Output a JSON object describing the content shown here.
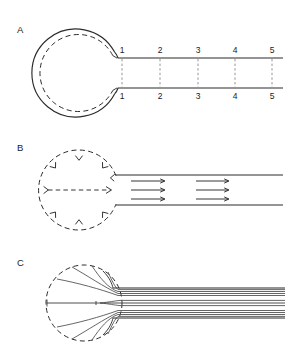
{
  "figure": {
    "background_color": "#ffffff",
    "ink_color": "#2b2b2b",
    "width": 288,
    "height": 363
  },
  "panels": [
    {
      "id": "A",
      "label": "A",
      "label_x": 17,
      "label_y": 33,
      "description": "Solid-walled spherical chamber with dashed inner boundary joined to a straight parallel-walled tube marked with five numbered stations",
      "chamber": {
        "style": "solid-outline-with-dashed-inner",
        "center_x": 79,
        "center_y": 73,
        "outer_radius": 44,
        "inner_radius": 38.5
      },
      "tube": {
        "top_wall_y": 58,
        "bottom_wall_y": 88,
        "start_x": 118,
        "end_x": 283
      },
      "stations": [
        {
          "label": "1",
          "x": 122
        },
        {
          "label": "2",
          "x": 160
        },
        {
          "label": "3",
          "x": 198
        },
        {
          "label": "4",
          "x": 235
        },
        {
          "label": "5",
          "x": 272
        }
      ],
      "station_label_top_y": 53,
      "station_label_bottom_y": 99
    },
    {
      "id": "B",
      "label": "B",
      "label_x": 17,
      "label_y": 151,
      "description": "Dashed spherical chamber with inward radial arrows and uniform plug-flow arrows inside the tube",
      "chamber": {
        "style": "dashed",
        "center_x": 79,
        "center_y": 190,
        "radius": 40
      },
      "tube": {
        "top_wall_y": 175,
        "bottom_wall_y": 205,
        "start_x": 116,
        "end_x": 283
      },
      "radial_arrow_count": 8,
      "center_arrow": {
        "label": "central dashed arrow",
        "x_start": 48,
        "x_end": 112,
        "y": 190
      },
      "flow_arrow_groups": [
        {
          "x_start": 131,
          "x_end": 164,
          "rows_y": [
            181,
            190,
            199
          ]
        },
        {
          "x_start": 196,
          "x_end": 228,
          "rows_y": [
            181,
            190,
            199
          ]
        }
      ]
    },
    {
      "id": "C",
      "label": "C",
      "label_x": 17,
      "label_y": 266,
      "description": "Dashed spherical chamber with curved converging streamlines that become parallel laminar profiles within the tube",
      "chamber": {
        "style": "dashed",
        "center_x": 84,
        "center_y": 303,
        "radius": 38
      },
      "tube": {
        "top_wall_y": 288,
        "bottom_wall_y": 318,
        "start_x": 118,
        "end_x": 285
      },
      "axis_line": {
        "x_start": 47,
        "x_end": 285,
        "y": 303
      },
      "streamline_count_in_tube": 7,
      "converging_streamline_count": 8
    }
  ]
}
